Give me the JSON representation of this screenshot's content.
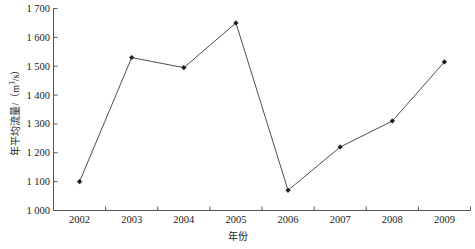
{
  "chart_data": {
    "type": "line",
    "title": "",
    "xlabel": "年份",
    "ylabel_text": "年平均流量/（m",
    "ylabel_sup": "3",
    "ylabel_tail": "/s）",
    "ylabel_full": "年平均流量/（m3/s）",
    "categories": [
      "2002",
      "2003",
      "2004",
      "2005",
      "2006",
      "2007",
      "2008",
      "2009"
    ],
    "x": [
      2002,
      2003,
      2004,
      2005,
      2006,
      2007,
      2008,
      2009
    ],
    "values": [
      1100,
      1530,
      1495,
      1650,
      1070,
      1220,
      1310,
      1515
    ],
    "series": [
      {
        "name": "年平均流量",
        "values": [
          1100,
          1530,
          1495,
          1650,
          1070,
          1220,
          1310,
          1515
        ]
      }
    ],
    "ylim": [
      1000,
      1700
    ],
    "yticks": [
      1000,
      1100,
      1200,
      1300,
      1400,
      1500,
      1600,
      1700
    ],
    "ytick_labels": [
      "1 000",
      "1 100",
      "1 200",
      "1 300",
      "1 400",
      "1 500",
      "1 600",
      "1 700"
    ],
    "xlim": [
      2001.5,
      2009.5
    ],
    "grid": false,
    "legend": "none",
    "line_color": "#3b3b3b",
    "marker_color": "#1a1a1a",
    "marker_shape": "diamond",
    "axis_color": "#555555",
    "background_color": "#ffffff"
  }
}
